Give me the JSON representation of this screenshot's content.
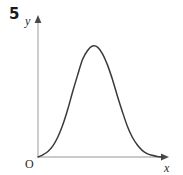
{
  "figure": {
    "problem_number": "5",
    "origin_label": "O",
    "x_axis_label": "x",
    "y_axis_label": "y",
    "background_color": "#ffffff",
    "axis_color": "#b8b8b8",
    "curve_color": "#3a3a3a",
    "label_color": "#2b2b2b"
  },
  "chart_data": {
    "type": "line",
    "title": "",
    "subtitle": "",
    "xlabel": "x",
    "ylabel": "y",
    "legend": [],
    "grid": false,
    "axes": {
      "x_origin_px": 38,
      "y_origin_px": 157,
      "x_end_px": 168,
      "y_top_px": 18,
      "arrowheads": [
        "x-axis-right",
        "y-axis-top"
      ],
      "tick_labels_x": [],
      "tick_labels_y": [],
      "xlim": [
        0,
        1
      ],
      "ylim": [
        0,
        1
      ]
    },
    "series": [
      {
        "name": "bell-curve",
        "x": [
          0.0,
          0.04,
          0.08,
          0.12,
          0.16,
          0.2,
          0.24,
          0.28,
          0.32,
          0.36,
          0.4,
          0.44,
          0.48,
          0.52,
          0.56,
          0.6,
          0.64,
          0.68,
          0.72,
          0.76,
          0.8,
          0.84,
          0.88,
          0.92,
          0.96,
          1.0
        ],
        "y": [
          0.0,
          0.02,
          0.05,
          0.1,
          0.18,
          0.29,
          0.43,
          0.59,
          0.74,
          0.88,
          0.96,
          1.0,
          0.99,
          0.93,
          0.83,
          0.7,
          0.55,
          0.41,
          0.28,
          0.18,
          0.11,
          0.06,
          0.03,
          0.015,
          0.005,
          0.0
        ]
      }
    ],
    "peak": {
      "x": 0.45,
      "y": 1.0
    }
  }
}
